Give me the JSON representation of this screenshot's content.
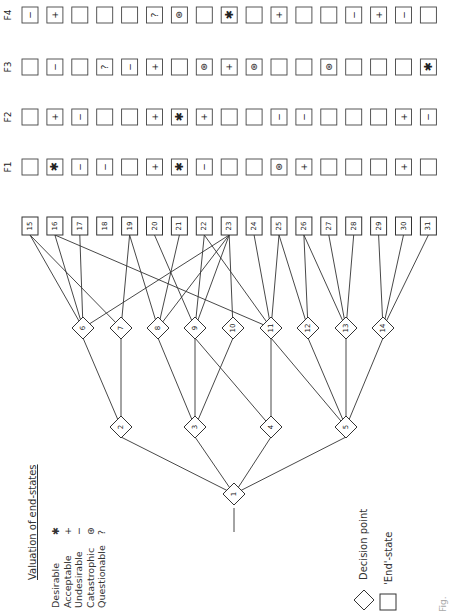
{
  "legend": {
    "title": "Valuation of end-states",
    "items": [
      {
        "label": "Desirable",
        "symbol": "✱"
      },
      {
        "label": "Acceptable",
        "symbol": "+"
      },
      {
        "label": "Undesirable",
        "symbol": "−"
      },
      {
        "label": "Catastrophic",
        "symbol": "⊛"
      },
      {
        "label": "Questionable",
        "symbol": "?"
      }
    ],
    "shapes": [
      {
        "shape": "diamond",
        "label": "Decision point"
      },
      {
        "shape": "square",
        "label": "'End'-state"
      }
    ]
  },
  "decision_points": [
    {
      "id": "1",
      "level": 0
    },
    {
      "id": "2",
      "level": 1
    },
    {
      "id": "3",
      "level": 1
    },
    {
      "id": "4",
      "level": 1
    },
    {
      "id": "5",
      "level": 1
    },
    {
      "id": "6",
      "level": 2
    },
    {
      "id": "7",
      "level": 2
    },
    {
      "id": "8",
      "level": 2
    },
    {
      "id": "9",
      "level": 2
    },
    {
      "id": "10",
      "level": 2
    },
    {
      "id": "11",
      "level": 2
    },
    {
      "id": "12",
      "level": 2
    },
    {
      "id": "13",
      "level": 2
    },
    {
      "id": "14",
      "level": 2
    }
  ],
  "end_states": [
    "15",
    "16",
    "17",
    "18",
    "19",
    "20",
    "21",
    "22",
    "23",
    "24",
    "25",
    "26",
    "27",
    "28",
    "29",
    "30",
    "31"
  ],
  "factors": [
    {
      "label": "F1",
      "values": [
        "",
        "✱",
        "−",
        "−",
        "",
        "+",
        "✱",
        "−",
        "",
        "",
        "⊛",
        "+",
        "",
        "",
        "",
        "+",
        ""
      ]
    },
    {
      "label": "F2",
      "values": [
        "",
        "+",
        "−",
        "",
        "",
        "+",
        "✱",
        "+",
        "",
        "",
        "−",
        "−",
        "",
        "",
        "",
        "+",
        "−"
      ]
    },
    {
      "label": "F3",
      "values": [
        "",
        "−",
        "",
        "?",
        "−",
        "+",
        "",
        "⊛",
        "+",
        "⊛",
        "",
        "",
        "⊛",
        "",
        "",
        "",
        "✱"
      ]
    },
    {
      "label": "F4",
      "values": [
        "−",
        "+",
        "",
        "",
        "",
        "?",
        "⊛",
        "",
        "✱",
        "",
        "+",
        "",
        "",
        "−",
        "+",
        "−",
        ""
      ]
    }
  ],
  "edges": {
    "root_to_level1": [
      [
        "1",
        "2"
      ],
      [
        "1",
        "3"
      ],
      [
        "1",
        "4"
      ],
      [
        "1",
        "5"
      ]
    ],
    "level1_to_level2": [
      [
        "2",
        "6"
      ],
      [
        "2",
        "7"
      ],
      [
        "3",
        "8"
      ],
      [
        "3",
        "9"
      ],
      [
        "3",
        "10"
      ],
      [
        "4",
        "9"
      ],
      [
        "4",
        "11"
      ],
      [
        "5",
        "11"
      ],
      [
        "5",
        "12"
      ],
      [
        "5",
        "13"
      ],
      [
        "5",
        "14"
      ]
    ],
    "level2_to_end": [
      [
        "6",
        "15"
      ],
      [
        "6",
        "16"
      ],
      [
        "6",
        "17"
      ],
      [
        "6",
        "23"
      ],
      [
        "7",
        "19"
      ],
      [
        "7",
        "15"
      ],
      [
        "8",
        "19"
      ],
      [
        "8",
        "21"
      ],
      [
        "8",
        "23"
      ],
      [
        "9",
        "20"
      ],
      [
        "9",
        "22"
      ],
      [
        "9",
        "23"
      ],
      [
        "10",
        "23"
      ],
      [
        "11",
        "24"
      ],
      [
        "11",
        "25"
      ],
      [
        "11",
        "22"
      ],
      [
        "11",
        "16"
      ],
      [
        "12",
        "25"
      ],
      [
        "12",
        "26"
      ],
      [
        "13",
        "26"
      ],
      [
        "13",
        "27"
      ],
      [
        "13",
        "28"
      ],
      [
        "14",
        "29"
      ],
      [
        "14",
        "30"
      ],
      [
        "14",
        "31"
      ]
    ]
  },
  "caption": "Fig."
}
